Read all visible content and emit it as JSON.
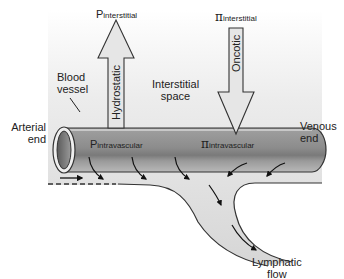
{
  "diagram": {
    "type": "capillary-starling-forces",
    "colors": {
      "interstitial_space": "#d8d8d8",
      "vessel_body": "#8a8a8a",
      "vessel_highlight": "#b4b4b4",
      "outline": "#333333",
      "arrow_fill": "#e0e0e0"
    }
  },
  "labels": {
    "p_interstitial": {
      "symbol": "P",
      "subscript": "interstitial"
    },
    "pi_interstitial": {
      "symbol": "π",
      "subscript": "interstitial"
    },
    "hydrostatic": "Hydrostatic",
    "oncotic": "Oncotic",
    "blood_vessel_line1": "Blood",
    "blood_vessel_line2": "vessel",
    "interstitial_space_line1": "Interstitial",
    "interstitial_space_line2": "space",
    "p_intravascular": {
      "symbol": "P",
      "subscript": "intravascular"
    },
    "pi_intravascular": {
      "symbol": "π",
      "subscript": "intravascular"
    },
    "arterial_end_line1": "Arterial",
    "arterial_end_line2": "end",
    "venous_end_line1": "Venous",
    "venous_end_line2": "end",
    "lymphatic_flow_line1": "Lymphatic",
    "lymphatic_flow_line2": "flow"
  }
}
